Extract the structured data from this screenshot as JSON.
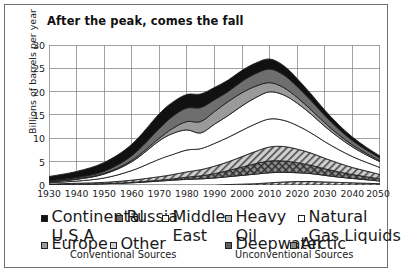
{
  "chart_data": {
    "type": "area",
    "title": "After the peak, comes the fall",
    "plot_label": "Global Production",
    "xlabel": "",
    "ylabel": "Billions of barrels per year",
    "xlim": [
      1930,
      2050
    ],
    "ylim": [
      0,
      32
    ],
    "yticks": [
      0,
      5,
      10,
      15,
      20,
      25,
      30
    ],
    "xticks": [
      1930,
      1940,
      1950,
      1960,
      1970,
      1980,
      1990,
      2000,
      2010,
      2020,
      2030,
      2040,
      2050
    ],
    "grid": true,
    "stacked": true,
    "legend_position": "bottom",
    "x": [
      1930,
      1940,
      1950,
      1960,
      1970,
      1975,
      1980,
      1985,
      1990,
      1995,
      2000,
      2005,
      2010,
      2015,
      2020,
      2025,
      2030,
      2035,
      2040,
      2045,
      2050
    ],
    "series": [
      {
        "name": "Arctic",
        "values": [
          0,
          0,
          0,
          0,
          0,
          0,
          0,
          0,
          0,
          0.1,
          0.2,
          0.3,
          0.5,
          0.7,
          0.8,
          0.8,
          0.7,
          0.6,
          0.5,
          0.4,
          0.3
        ]
      },
      {
        "name": "Natural Gas Liquids",
        "values": [
          0.1,
          0.2,
          0.3,
          0.5,
          0.9,
          1.1,
          1.3,
          1.4,
          1.6,
          1.8,
          2.0,
          2.2,
          2.3,
          2.2,
          2.0,
          1.8,
          1.5,
          1.2,
          1.0,
          0.8,
          0.6
        ]
      },
      {
        "name": "Deepwater",
        "values": [
          0,
          0,
          0,
          0.1,
          0.2,
          0.3,
          0.5,
          0.7,
          1.0,
          1.4,
          1.9,
          2.4,
          2.7,
          2.6,
          2.3,
          1.9,
          1.5,
          1.2,
          0.9,
          0.7,
          0.5
        ]
      },
      {
        "name": "Heavy Oil",
        "values": [
          0.1,
          0.2,
          0.3,
          0.5,
          0.8,
          1.0,
          1.2,
          1.4,
          1.7,
          2.0,
          2.4,
          2.8,
          3.2,
          3.3,
          3.1,
          2.8,
          2.4,
          2.0,
          1.6,
          1.3,
          1.0
        ]
      },
      {
        "name": "Other",
        "values": [
          0.3,
          0.5,
          1.0,
          2.2,
          4.0,
          4.6,
          5.0,
          4.8,
          5.2,
          5.6,
          6.0,
          6.3,
          6.4,
          6.0,
          5.4,
          4.6,
          3.8,
          3.1,
          2.5,
          2.0,
          1.6
        ]
      },
      {
        "name": "Middle East",
        "values": [
          0.2,
          0.4,
          0.9,
          2.0,
          4.2,
          4.8,
          4.6,
          3.6,
          4.4,
          5.0,
          5.6,
          6.0,
          6.2,
          5.8,
          5.1,
          4.3,
          3.5,
          2.8,
          2.2,
          1.7,
          1.3
        ]
      },
      {
        "name": "Europe",
        "values": [
          0.05,
          0.1,
          0.15,
          0.3,
          0.6,
          1.2,
          1.9,
          2.6,
          2.9,
          3.2,
          3.0,
          2.6,
          2.1,
          1.7,
          1.3,
          1.0,
          0.8,
          0.6,
          0.45,
          0.35,
          0.25
        ]
      },
      {
        "name": "Russia",
        "values": [
          0.2,
          0.3,
          0.5,
          1.1,
          2.2,
          2.8,
          3.1,
          3.2,
          2.7,
          2.3,
          2.6,
          2.9,
          3.1,
          2.9,
          2.5,
          2.1,
          1.7,
          1.3,
          1.0,
          0.8,
          0.6
        ]
      },
      {
        "name": "Continental U.S.A",
        "values": [
          1.0,
          1.4,
          2.0,
          2.6,
          3.4,
          3.2,
          3.1,
          3.1,
          2.8,
          2.6,
          2.5,
          2.4,
          2.3,
          2.1,
          1.8,
          1.5,
          1.2,
          1.0,
          0.8,
          0.6,
          0.5
        ]
      }
    ],
    "totals": [
      1.95,
      3.1,
      5.15,
      9.3,
      16.3,
      19.0,
      20.7,
      20.8,
      22.3,
      24.0,
      26.2,
      27.9,
      28.8,
      27.3,
      24.3,
      20.8,
      17.1,
      13.8,
      10.9,
      8.65,
      6.65
    ],
    "peak_year": 2010,
    "peak_value": 30
  },
  "legend": {
    "conventional_label": "Conventional Sources",
    "unconventional_label": "Unconventional Sources",
    "items": [
      {
        "label": "Continental U.S.A",
        "group": "conventional"
      },
      {
        "label": "Russia",
        "group": "conventional"
      },
      {
        "label": "Middle East",
        "group": "conventional"
      },
      {
        "label": "Europe",
        "group": "conventional"
      },
      {
        "label": "Other",
        "group": "conventional"
      },
      {
        "label": "Heavy Oil",
        "group": "unconventional"
      },
      {
        "label": "Natural Gas Liquids",
        "group": "unconventional"
      },
      {
        "label": "Deepwater",
        "group": "unconventional"
      },
      {
        "label": "Arctic",
        "group": "unconventional"
      }
    ],
    "continental_line1": "Continental",
    "continental_line2": "U.S.A",
    "russia": "Russia",
    "middle_line1": "Middle",
    "middle_line2": "East",
    "europe": "Europe",
    "other": "Other",
    "heavy_line1": "Heavy",
    "heavy_line2": "Oil",
    "ngl_line1": "Natural",
    "ngl_line2": "Gas Liquids",
    "deepwater": "Deepwater",
    "arctic": "Arctic"
  },
  "axis": {
    "y": [
      "30",
      "25",
      "20",
      "15",
      "10",
      "5",
      "0"
    ],
    "x": [
      "1930",
      "1940",
      "1950",
      "1960",
      "1970",
      "1980",
      "1990",
      "2000",
      "2010",
      "2020",
      "2030",
      "2040",
      "2050"
    ]
  }
}
